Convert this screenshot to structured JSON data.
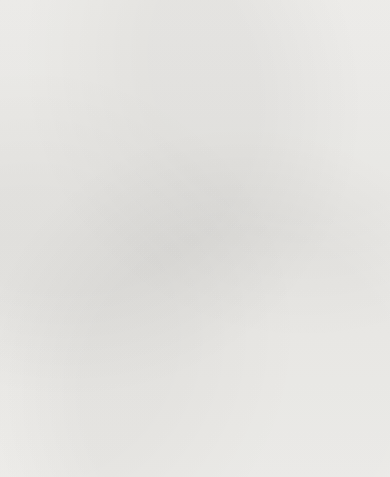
{
  "figure": {
    "top_axis_label": "Introversion",
    "bottom_axis_label": "Extraversion",
    "x_axis_label": "Neuroticism",
    "angle_symbol": "φ"
  },
  "chart_data": {
    "type": "scatter",
    "title": "",
    "subtitle": "",
    "xlabel": "Neuroticism",
    "ylabel": "",
    "ylabel_top": "Introversion",
    "ylabel_bottom": "Extraversion",
    "grid": false,
    "legend": "none",
    "xlim": [
      0.0,
      0.75
    ],
    "ylim": [
      -0.5,
      0.6
    ],
    "xticks": [
      0.1,
      0.2,
      0.3,
      0.4,
      0.5,
      0.6,
      0.7
    ],
    "xticklabels": [
      "0.1",
      "0.2",
      "0.3",
      "0.4",
      "0.5",
      "0.6",
      "0.7"
    ],
    "yticks": [
      0.6,
      0.5,
      0.4,
      0.3,
      0.2,
      0.1,
      0.0,
      -0.1,
      -0.2,
      -0.3,
      -0.4,
      -0.5
    ],
    "yticklabels": [
      "0.6",
      "0.5",
      "0.4",
      "0.3",
      "0.2",
      "0.1",
      "0",
      "-0.1",
      "-0.2",
      "-0.3",
      "-0.4",
      "-0.5"
    ],
    "points": [
      {
        "label": "Psychoneurotic",
        "x": 0.3,
        "y": 0.487,
        "lx": 8,
        "ly": -4,
        "anchor": "start"
      },
      {
        "label": "Sensitive",
        "x": 0.372,
        "y": 0.452,
        "lx": 8,
        "ly": 3,
        "anchor": "start"
      },
      {
        "label": "Absent-minded",
        "x": 0.3,
        "y": 0.347,
        "lx": -5,
        "ly": -9,
        "anchor": "end"
      },
      {
        "label": "Seclusive",
        "x": 0.272,
        "y": 0.34,
        "lx": -8,
        "ly": 3,
        "anchor": "end"
      },
      {
        "label": "Day-dreams",
        "x": 0.37,
        "y": 0.343,
        "lx": 8,
        "ly": 2,
        "anchor": "start"
      },
      {
        "label": "Depressed",
        "x": 0.312,
        "y": 0.33,
        "lx": -8,
        "ly": 11,
        "anchor": "end"
      },
      {
        "label": "Inefficient",
        "x": 0.368,
        "y": 0.3,
        "lx": 8,
        "ly": 3,
        "anchor": "start"
      },
      {
        "label": "Inferiority feelings",
        "x": 0.358,
        "y": 0.262,
        "lx": -8,
        "ly": 3,
        "anchor": "end"
      },
      {
        "label": "Queer",
        "x": 0.398,
        "y": 0.262,
        "lx": 8,
        "ly": 3,
        "anchor": "start"
      },
      {
        "label": "Personality problems",
        "x": 0.7,
        "y": 0.305,
        "lx": 4,
        "ly": -9,
        "anchor": "middle"
      },
      {
        "label": "Changeable mood",
        "x": 0.318,
        "y": 0.208,
        "lx": -8,
        "ly": 3,
        "anchor": "end"
      },
      {
        "label": "Nervous",
        "x": 0.528,
        "y": 0.195,
        "lx": 8,
        "ly": 3,
        "anchor": "start"
      },
      {
        "label": "Mental conflict",
        "x": 0.352,
        "y": 0.152,
        "lx": 8,
        "ly": 4,
        "anchor": "start"
      },
      {
        "label": "Intelligent",
        "x": 0.268,
        "y": 0.118,
        "lx": -8,
        "ly": 2,
        "anchor": "end"
      },
      {
        "label": "Irritable",
        "x": 0.452,
        "y": 0.108,
        "lx": 8,
        "ly": 3,
        "anchor": "start"
      },
      {
        "label": "Emotionally",
        "x": 0.33,
        "y": 0.1,
        "lx": -4,
        "ly": 12,
        "anchor": "middle"
      },
      {
        "label": "unstable",
        "x": null,
        "y": null,
        "lx": 0,
        "ly": 0,
        "anchor": "middle",
        "continuation_of": "Emotionally"
      },
      {
        "label": "Lazy",
        "x": 0.39,
        "y": 0.09,
        "lx": 8,
        "ly": 3,
        "anchor": "start"
      },
      {
        "label": "Masturbation",
        "x": 0.448,
        "y": 0.06,
        "lx": 8,
        "ly": 3,
        "anchor": "start"
      },
      {
        "label": "Spoiled",
        "x": 0.418,
        "y": 0.057,
        "lx": -6,
        "ly": -8,
        "anchor": "middle"
      },
      {
        "label": "Irresponsible",
        "x": 0.322,
        "y": 0.018,
        "lx": -8,
        "ly": -6,
        "anchor": "end"
      },
      {
        "label": "Lacks interest",
        "x": 0.408,
        "y": -0.018,
        "lx": -4,
        "ly": 12,
        "anchor": "middle"
      },
      {
        "label": "Sexual",
        "x": 0.33,
        "y": -0.052,
        "lx": -2,
        "ly": 13,
        "anchor": "middle"
      },
      {
        "label": "delinquency",
        "x": null,
        "y": null,
        "lx": 0,
        "ly": 0,
        "anchor": "middle",
        "continuation_of": "Sexual"
      },
      {
        "label": "Bossy",
        "x": 0.432,
        "y": -0.062,
        "lx": 10,
        "ly": 3,
        "anchor": "start"
      },
      {
        "label": "Bossy2",
        "x": 0.442,
        "y": -0.058,
        "lx": 0,
        "ly": 0,
        "anchor": "middle",
        "hide_label": true
      },
      {
        "label": "Temper tantrums",
        "x": 0.555,
        "y": -0.078,
        "lx": 10,
        "ly": 3,
        "anchor": "start"
      },
      {
        "label": "Temper tantrums2",
        "x": 0.538,
        "y": -0.078,
        "lx": 0,
        "ly": 0,
        "anchor": "middle",
        "hide_label": true
      },
      {
        "label": "Unpopular",
        "x": 0.462,
        "y": -0.082,
        "lx": -4,
        "ly": 12,
        "anchor": "middle"
      },
      {
        "label": "Fantastic lying",
        "x": 0.548,
        "y": -0.122,
        "lx": 10,
        "ly": 3,
        "anchor": "start"
      },
      {
        "label": "Egocentric",
        "x": 0.452,
        "y": -0.182,
        "lx": 10,
        "ly": 3,
        "anchor": "start"
      },
      {
        "label": "Rude",
        "x": 0.512,
        "y": -0.232,
        "lx": 10,
        "ly": 3,
        "anchor": "start"
      },
      {
        "label": "Violent",
        "x": 0.452,
        "y": -0.272,
        "lx": -4,
        "ly": -8,
        "anchor": "middle"
      },
      {
        "label": "Disturbing influence",
        "x": 0.43,
        "y": -0.312,
        "lx": -8,
        "ly": 3,
        "anchor": "end"
      },
      {
        "label": "Disobedient",
        "x": 0.412,
        "y": -0.322,
        "lx": -8,
        "ly": 12,
        "anchor": "end"
      },
      {
        "label": "Fighting",
        "x": 0.545,
        "y": -0.305,
        "lx": -4,
        "ly": 13,
        "anchor": "middle"
      },
      {
        "label": "Swearing",
        "x": 0.47,
        "y": -0.342,
        "lx": -4,
        "ly": 13,
        "anchor": "middle"
      },
      {
        "label": "Conduct problems",
        "x": 0.708,
        "y": -0.348,
        "lx": -4,
        "ly": 13,
        "anchor": "middle"
      },
      {
        "label": "Destructive",
        "x": 0.432,
        "y": -0.378,
        "lx": -8,
        "ly": 3,
        "anchor": "end"
      },
      {
        "label": "Destructive2",
        "x": 0.442,
        "y": -0.385,
        "lx": 0,
        "ly": 0,
        "anchor": "middle",
        "hide_label": true
      },
      {
        "label": "Lying",
        "x": null,
        "y": null,
        "lx": 0,
        "ly": 0,
        "anchor": "middle",
        "label_only_at": [
          243,
          424
        ]
      },
      {
        "label": "Truant (home)",
        "x": 0.478,
        "y": -0.425,
        "lx": -4,
        "ly": -8,
        "anchor": "middle"
      },
      {
        "label": "Truant (school)",
        "x": 0.338,
        "y": -0.425,
        "lx": -8,
        "ly": 3,
        "anchor": "end"
      },
      {
        "label": "Stealing",
        "x": 0.53,
        "y": -0.452,
        "lx": 10,
        "ly": 3,
        "anchor": "start"
      }
    ],
    "vectors": [
      {
        "name": "personality-problems-vector",
        "from": [
          0.0,
          0.0
        ],
        "to": [
          0.7,
          0.305
        ],
        "style": "dashed-arrow"
      },
      {
        "name": "conduct-problems-vector",
        "from": [
          0.0,
          0.0
        ],
        "to": [
          0.708,
          -0.348
        ],
        "style": "dashed-arrow"
      }
    ]
  }
}
